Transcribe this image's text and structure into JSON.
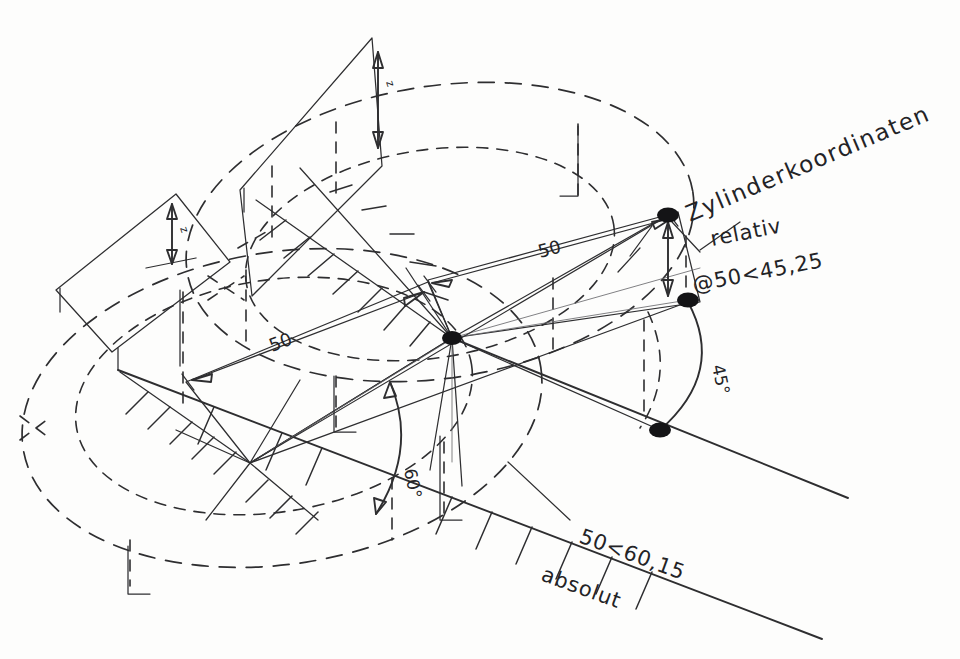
{
  "document": {
    "title": "Zylinderkoordinaten",
    "kind": "technical-sketch",
    "background_color": "#fdfdfc",
    "ink_color": "#2e2e30"
  },
  "annotations": {
    "title": "Zylinderkoordinaten",
    "relative_label": "relativ",
    "relative_value": "@50<45,25",
    "absolute_value": "50<60,15",
    "absolute_label": "absolut",
    "dim_upper": "50",
    "dim_lower": "50",
    "angle_phi_lower": "60°",
    "angle_phi_upper": "45°",
    "height_mark_upper": "z",
    "height_mark_left": "z"
  },
  "geometry": {
    "origin": {
      "x": 452,
      "y": 338,
      "name": "coordinate-origin"
    },
    "projection_point": {
      "x": 250,
      "y": 463,
      "name": "lower-projection-point"
    },
    "points": [
      {
        "name": "relative-endpoint-upper",
        "x": 668,
        "y": 215,
        "r": 9
      },
      {
        "name": "relative-endpoint-mid",
        "x": 688,
        "y": 300,
        "r": 9
      },
      {
        "name": "absolute-endpoint-lower",
        "x": 660,
        "y": 430,
        "r": 9
      }
    ],
    "ellipses": [
      {
        "name": "upper-plane-outer",
        "cx": 440,
        "cy": 230,
        "rx": 252,
        "ry": 140,
        "rot": -8
      },
      {
        "name": "upper-plane-inner",
        "cx": 432,
        "cy": 252,
        "rx": 182,
        "ry": 100,
        "rot": -8
      },
      {
        "name": "lower-plane-outer",
        "cx": 280,
        "cy": 410,
        "rx": 258,
        "ry": 152,
        "rot": -8
      },
      {
        "name": "lower-plane-inner",
        "cx": 272,
        "cy": 400,
        "rx": 196,
        "ry": 112,
        "rot": -8
      }
    ],
    "axes": [
      {
        "name": "axis-absolute-lower",
        "x1": 120,
        "y1": 372,
        "x2": 820,
        "y2": 637
      },
      {
        "name": "axis-radial-upper",
        "x1": 452,
        "y1": 338,
        "x2": 845,
        "y2": 496
      }
    ],
    "hatching": {
      "upper_sector_ticks": 10,
      "lower_sector_ticks": 9,
      "axis_ticks": 7
    }
  }
}
